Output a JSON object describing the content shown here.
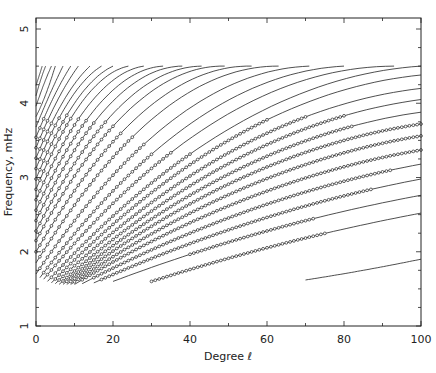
{
  "chart_data": {
    "type": "scatter",
    "title": "",
    "xlabel": "Degree ℓ",
    "ylabel": "Frequency, mHz",
    "xlim": [
      0,
      100
    ],
    "ylim": [
      1,
      5
    ],
    "x_ticks": [
      "0",
      "20",
      "40",
      "60",
      "80",
      "100"
    ],
    "y_ticks": [
      "1",
      "2",
      "3",
      "4",
      "5"
    ],
    "grid": false,
    "legend": null,
    "ridges": [
      {
        "pts": [
          [
            70,
            1.62
          ],
          [
            85,
            1.75
          ],
          [
            100,
            1.9
          ]
        ],
        "obs": null
      },
      {
        "pts": [
          [
            30,
            1.6
          ],
          [
            65,
            2.12
          ],
          [
            100,
            2.52
          ]
        ],
        "obs": [
          30,
          75
        ]
      },
      {
        "pts": [
          [
            20,
            1.6
          ],
          [
            60,
            2.28
          ],
          [
            100,
            2.76
          ]
        ],
        "obs": [
          40,
          72
        ]
      },
      {
        "pts": [
          [
            15,
            1.58
          ],
          [
            55,
            2.38
          ],
          [
            100,
            2.98
          ]
        ],
        "obs": [
          17,
          87
        ]
      },
      {
        "pts": [
          [
            12,
            1.57
          ],
          [
            55,
            2.55
          ],
          [
            100,
            3.18
          ]
        ],
        "obs": [
          15,
          92
        ]
      },
      {
        "pts": [
          [
            10,
            1.56
          ],
          [
            55,
            2.72
          ],
          [
            100,
            3.37
          ]
        ],
        "obs": [
          12,
          100
        ]
      },
      {
        "pts": [
          [
            9,
            1.56
          ],
          [
            55,
            2.88
          ],
          [
            100,
            3.56
          ]
        ],
        "obs": [
          10,
          100
        ]
      },
      {
        "pts": [
          [
            8,
            1.56
          ],
          [
            55,
            3.03
          ],
          [
            100,
            3.72
          ]
        ],
        "obs": [
          9,
          100
        ]
      },
      {
        "pts": [
          [
            7,
            1.56
          ],
          [
            55,
            3.17
          ],
          [
            100,
            3.88
          ]
        ],
        "obs": [
          8,
          82
        ]
      },
      {
        "pts": [
          [
            6,
            1.56
          ],
          [
            55,
            3.32
          ],
          [
            100,
            4.05
          ]
        ],
        "obs": [
          7,
          80
        ]
      },
      {
        "pts": [
          [
            5,
            1.57
          ],
          [
            55,
            3.47
          ],
          [
            100,
            4.2
          ]
        ],
        "obs": [
          6,
          70
        ]
      },
      {
        "pts": [
          [
            4,
            1.58
          ],
          [
            50,
            3.5
          ],
          [
            100,
            4.38
          ]
        ],
        "obs": [
          5,
          60
        ]
      },
      {
        "pts": [
          [
            3,
            1.6
          ],
          [
            50,
            3.65
          ],
          [
            100,
            4.5
          ]
        ],
        "obs": [
          4,
          40
        ]
      },
      {
        "pts": [
          [
            2,
            1.63
          ],
          [
            45,
            3.7
          ],
          [
            93,
            4.5
          ]
        ],
        "obs": [
          3,
          35
        ]
      },
      {
        "pts": [
          [
            1,
            1.65
          ],
          [
            40,
            3.72
          ],
          [
            80,
            4.5
          ]
        ],
        "obs": [
          2,
          30
        ]
      },
      {
        "pts": [
          [
            0,
            1.7
          ],
          [
            35,
            3.75
          ],
          [
            71,
            4.5
          ]
        ],
        "obs": [
          1,
          28
        ]
      },
      {
        "pts": [
          [
            0,
            1.85
          ],
          [
            30,
            3.78
          ],
          [
            63,
            4.5
          ]
        ],
        "obs": [
          1,
          25
        ]
      },
      {
        "pts": [
          [
            0,
            2.0
          ],
          [
            25,
            3.75
          ],
          [
            56,
            4.5
          ]
        ],
        "obs": [
          0,
          22
        ]
      },
      {
        "pts": [
          [
            0,
            2.15
          ],
          [
            22,
            3.8
          ],
          [
            49,
            4.5
          ]
        ],
        "obs": [
          0,
          20
        ]
      },
      {
        "pts": [
          [
            0,
            2.28
          ],
          [
            20,
            3.86
          ],
          [
            43,
            4.5
          ]
        ],
        "obs": [
          0,
          18
        ]
      },
      {
        "pts": [
          [
            0,
            2.42
          ],
          [
            18,
            3.92
          ],
          [
            38,
            4.5
          ]
        ],
        "obs": [
          0,
          15
        ]
      },
      {
        "pts": [
          [
            0,
            2.56
          ],
          [
            15,
            3.9
          ],
          [
            33,
            4.5
          ]
        ],
        "obs": [
          0,
          13
        ]
      },
      {
        "pts": [
          [
            0,
            2.7
          ],
          [
            13,
            3.93
          ],
          [
            28,
            4.5
          ]
        ],
        "obs": [
          0,
          11
        ]
      },
      {
        "pts": [
          [
            0,
            2.84
          ],
          [
            11,
            3.95
          ],
          [
            24,
            4.5
          ]
        ],
        "obs": [
          0,
          9
        ]
      },
      {
        "pts": [
          [
            0,
            2.98
          ],
          [
            10,
            4.0
          ],
          [
            20,
            4.5
          ]
        ],
        "obs": [
          0,
          8
        ]
      },
      {
        "pts": [
          [
            0,
            3.12
          ],
          [
            8,
            3.98
          ],
          [
            17,
            4.5
          ]
        ],
        "obs": [
          0,
          6
        ]
      },
      {
        "pts": [
          [
            0,
            3.26
          ],
          [
            7,
            4.02
          ],
          [
            14,
            4.5
          ]
        ],
        "obs": [
          0,
          4
        ]
      },
      {
        "pts": [
          [
            0,
            3.4
          ],
          [
            5,
            3.98
          ],
          [
            11,
            4.5
          ]
        ],
        "obs": [
          0,
          3
        ]
      },
      {
        "pts": [
          [
            0,
            3.54
          ],
          [
            4,
            4.02
          ],
          [
            9,
            4.5
          ]
        ],
        "obs": [
          0,
          2
        ]
      },
      {
        "pts": [
          [
            0,
            3.68
          ],
          [
            3,
            4.05
          ],
          [
            7,
            4.5
          ]
        ],
        "obs": null
      },
      {
        "pts": [
          [
            0,
            3.82
          ],
          [
            2,
            4.05
          ],
          [
            5,
            4.5
          ]
        ],
        "obs": null
      },
      {
        "pts": [
          [
            0,
            3.96
          ],
          [
            2,
            4.25
          ],
          [
            4,
            4.5
          ]
        ],
        "obs": null
      },
      {
        "pts": [
          [
            0,
            4.1
          ],
          [
            1,
            4.28
          ],
          [
            2.5,
            4.5
          ]
        ],
        "obs": null
      },
      {
        "pts": [
          [
            0,
            4.24
          ],
          [
            1,
            4.4
          ],
          [
            1.6,
            4.5
          ]
        ],
        "obs": null
      }
    ]
  },
  "axes": {
    "xlabel": "Degree ℓ",
    "ylabel": "Frequency, mHz"
  }
}
